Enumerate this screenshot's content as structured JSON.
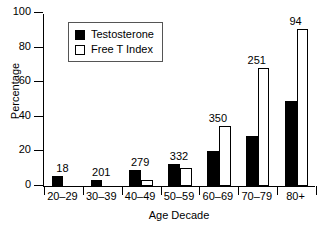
{
  "chart_data": {
    "type": "bar",
    "title": "",
    "xlabel": "Age Decade",
    "ylabel": "Percentage",
    "ylim": [
      0,
      100
    ],
    "yticks": [
      0,
      20,
      40,
      60,
      80,
      100
    ],
    "ytick_labels": [
      "0",
      "20",
      "40",
      "60",
      "80",
      "100"
    ],
    "grid": false,
    "legend_position": "upper left inside",
    "categories": [
      "20–29",
      "30–39",
      "40–49",
      "50–59",
      "60–69",
      "70–79",
      "80+"
    ],
    "series": [
      {
        "name": "Testosterone",
        "color": "#000000",
        "style": "filled",
        "values": [
          6,
          3.5,
          9,
          13,
          20,
          29,
          49
        ]
      },
      {
        "name": "Free T Index",
        "color": "#ffffff",
        "style": "hollow",
        "values": [
          0,
          0,
          3.5,
          10.5,
          34.5,
          68,
          91
        ]
      }
    ],
    "group_annotations": [
      "18",
      "201",
      "279",
      "332",
      "350",
      "251",
      "94"
    ],
    "annotation_note": "Number of subjects per age decade, printed above each group"
  },
  "legend": {
    "entries": [
      {
        "label": "Testosterone",
        "swatch": "filled-square-icon"
      },
      {
        "label": "Free T Index",
        "swatch": "hollow-square-icon"
      }
    ]
  }
}
